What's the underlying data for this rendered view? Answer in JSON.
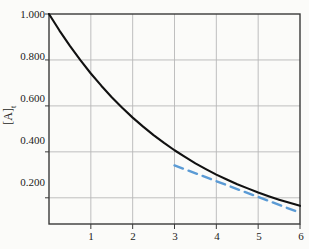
{
  "chart_data": {
    "type": "line",
    "title": "",
    "xlabel": "",
    "ylabel": "[A]t",
    "ylabel_display": "[A]",
    "ylabel_subscript": "t",
    "xlim": [
      0,
      6
    ],
    "ylim": [
      0.086,
      1.0
    ],
    "grid": true,
    "legend": "none",
    "x_ticks": [
      0,
      1,
      2,
      3,
      4,
      5,
      6
    ],
    "x_tick_labels": [
      "",
      "1",
      "2",
      "3",
      "4",
      "5",
      "6"
    ],
    "y_ticks": [
      0.2,
      0.4,
      0.6,
      0.8,
      1.0
    ],
    "y_tick_labels": [
      "0.200",
      "0.400",
      "0.600",
      "0.800",
      "1.000"
    ],
    "series": [
      {
        "name": "concentration-decay-curve",
        "style": "solid",
        "color": "#111111",
        "width": 2.1,
        "x": [
          0.0,
          0.25,
          0.5,
          0.75,
          1.0,
          1.25,
          1.5,
          1.75,
          2.0,
          2.25,
          2.5,
          2.75,
          3.0,
          3.25,
          3.5,
          3.75,
          4.0,
          4.25,
          4.5,
          4.75,
          5.0,
          5.25,
          5.5,
          5.75,
          6.0
        ],
        "values": [
          1.0,
          0.928,
          0.861,
          0.799,
          0.741,
          0.688,
          0.638,
          0.592,
          0.549,
          0.51,
          0.473,
          0.439,
          0.407,
          0.378,
          0.35,
          0.325,
          0.301,
          0.28,
          0.259,
          0.241,
          0.223,
          0.207,
          0.192,
          0.178,
          0.165
        ]
      },
      {
        "name": "tangent-dashed-line",
        "style": "dashed",
        "color": "#5b9bd5",
        "width": 2.4,
        "x": [
          3.0,
          6.0
        ],
        "values": [
          0.341,
          0.135
        ]
      }
    ],
    "axis_color": "#3a3a3a",
    "grid_color": "#b8b8b8",
    "background_color": "#fbfbf9"
  },
  "figure": {
    "plot_left": 49,
    "plot_right": 300,
    "plot_top": 14,
    "plot_bottom": 224
  }
}
